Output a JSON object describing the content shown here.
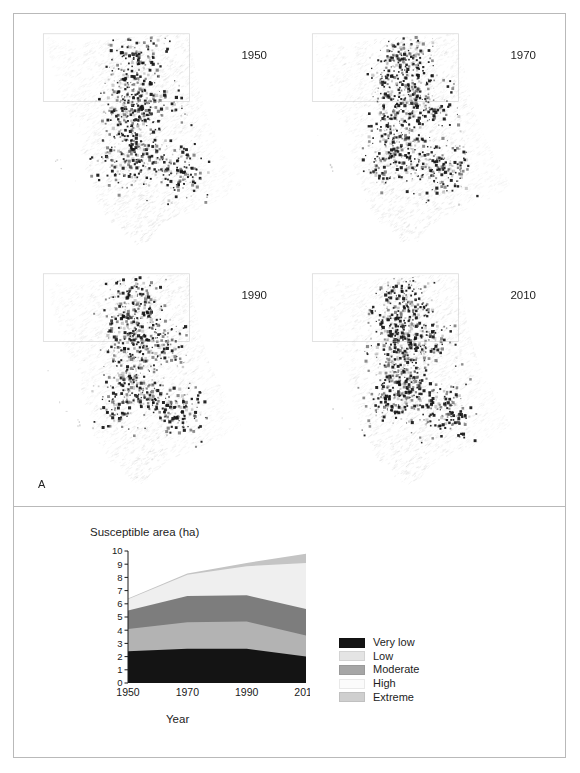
{
  "figure": {
    "panel_a": {
      "letter": "A",
      "maps": [
        {
          "year": "1950",
          "name": "map-1950",
          "seed": 11
        },
        {
          "year": "1970",
          "name": "map-1970",
          "seed": 27
        },
        {
          "year": "1990",
          "name": "map-1990",
          "seed": 43
        },
        {
          "year": "2010",
          "name": "map-2010",
          "seed": 61
        }
      ]
    },
    "panel_b": {
      "letter": "B",
      "legend_title": ""
    }
  },
  "chart_data": {
    "type": "area",
    "title": "Susceptible area (ha)",
    "xlabel": "Year",
    "ylabel": "",
    "categories": [
      "1950",
      "1970",
      "1990",
      "2010"
    ],
    "x": [
      1950,
      1970,
      1990,
      2010
    ],
    "xlim": [
      1950,
      2010
    ],
    "ylim": [
      0,
      10
    ],
    "yticks": [
      0,
      1,
      2,
      3,
      4,
      5,
      6,
      7,
      8,
      9,
      10
    ],
    "ytick_labels": [
      "0",
      "1",
      "2",
      "3",
      "4",
      "5",
      "6",
      "7",
      "8",
      "9",
      "10"
    ],
    "xtick_labels": [
      "1950",
      "1970",
      "1990",
      "2010"
    ],
    "grid": false,
    "stacked": true,
    "legend_position": "right",
    "series": [
      {
        "name": "Very low",
        "color": "#141414",
        "values": [
          2.4,
          2.6,
          2.6,
          2.0
        ]
      },
      {
        "name": "Low",
        "color": "#b3b3b3",
        "values": [
          1.7,
          2.0,
          2.05,
          1.6
        ]
      },
      {
        "name": "Moderate",
        "color": "#7d7d7d",
        "values": [
          1.4,
          2.0,
          2.0,
          2.0
        ]
      },
      {
        "name": "High",
        "color": "#efefef",
        "values": [
          0.85,
          1.6,
          2.2,
          3.5
        ]
      },
      {
        "name": "Extreme",
        "color": "#c4c4c4",
        "values": [
          0.05,
          0.1,
          0.25,
          0.7
        ]
      }
    ],
    "cumulative": [
      {
        "name": "Very low",
        "values": [
          2.4,
          2.6,
          2.6,
          2.0
        ]
      },
      {
        "name": "Low",
        "values": [
          4.1,
          4.6,
          4.65,
          3.6
        ]
      },
      {
        "name": "Moderate",
        "values": [
          5.5,
          6.6,
          6.65,
          5.6
        ]
      },
      {
        "name": "High",
        "values": [
          6.35,
          8.2,
          8.85,
          9.1
        ]
      },
      {
        "name": "Extreme",
        "values": [
          6.4,
          8.3,
          9.1,
          9.8
        ]
      }
    ],
    "legend": [
      {
        "label": "Very low",
        "color": "#141414"
      },
      {
        "label": "Low",
        "color": "#e4e4e4"
      },
      {
        "label": "Moderate",
        "color": "#a6a6a6"
      },
      {
        "label": "High",
        "color": "#fbfbfb"
      },
      {
        "label": "Extreme",
        "color": "#cfcfcf"
      }
    ]
  }
}
